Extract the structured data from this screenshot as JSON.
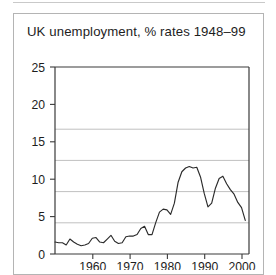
{
  "figure": {
    "title": "UK unemployment, % rates 1948–99",
    "background_color": "#ffffff",
    "frame_color": "#b4b4b4"
  },
  "chart_data": {
    "type": "line",
    "title": "UK unemployment, % rates 1948–99",
    "xlabel": "",
    "ylabel": "",
    "xlim": [
      1948,
      2000
    ],
    "ylim": [
      0,
      25
    ],
    "grid": true,
    "grid_axis": "y",
    "legend": false,
    "line_color": "#2b2b2b",
    "x_ticks": [
      1960,
      1970,
      1980,
      1990,
      2000
    ],
    "y_ticks": [
      0,
      5,
      10,
      15,
      20,
      25
    ],
    "x_tick_labels": [
      "1960",
      "1970",
      "1980",
      "1990",
      "2000"
    ],
    "y_tick_labels": [
      "0",
      "5",
      "10",
      "15",
      "20",
      "25"
    ],
    "series": [
      {
        "name": "UK unemployment rate (%)",
        "x": [
          1948,
          1949,
          1950,
          1951,
          1952,
          1953,
          1954,
          1955,
          1956,
          1957,
          1958,
          1959,
          1960,
          1961,
          1962,
          1963,
          1964,
          1965,
          1966,
          1967,
          1968,
          1969,
          1970,
          1971,
          1972,
          1973,
          1974,
          1975,
          1976,
          1977,
          1978,
          1979,
          1980,
          1981,
          1982,
          1983,
          1984,
          1985,
          1986,
          1987,
          1988,
          1989,
          1990,
          1991,
          1992,
          1993,
          1994,
          1995,
          1996,
          1997,
          1998,
          1999
        ],
        "values": [
          1.6,
          1.5,
          1.5,
          1.2,
          2.0,
          1.6,
          1.3,
          1.1,
          1.2,
          1.4,
          2.1,
          2.2,
          1.6,
          1.5,
          2.0,
          2.5,
          1.7,
          1.4,
          1.5,
          2.3,
          2.4,
          2.4,
          2.6,
          3.4,
          3.7,
          2.6,
          2.6,
          4.2,
          5.6,
          6.0,
          5.9,
          5.3,
          6.8,
          9.6,
          11.0,
          11.5,
          11.7,
          11.5,
          11.6,
          10.3,
          8.1,
          6.3,
          6.8,
          8.8,
          10.1,
          10.4,
          9.4,
          8.6,
          8.0,
          6.9,
          6.2,
          4.5
        ]
      }
    ]
  },
  "axes": {
    "y_labels": [
      "25",
      "20",
      "15",
      "10",
      "5",
      "0"
    ],
    "x_labels": [
      "1960",
      "1970",
      "1980",
      "1990",
      "2000"
    ]
  }
}
